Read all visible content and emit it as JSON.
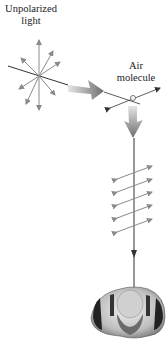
{
  "labels": {
    "unpolarized": [
      "Unpolarized",
      "light"
    ],
    "air_molecule": [
      "Air",
      "molecule"
    ]
  },
  "colors": {
    "line": "#333333",
    "arrow": "#8a8a8a",
    "big_arrow_dark": "#707070",
    "big_arrow_light": "#dcdcdc"
  },
  "figure": {
    "polarized_arrow_count": 5
  }
}
